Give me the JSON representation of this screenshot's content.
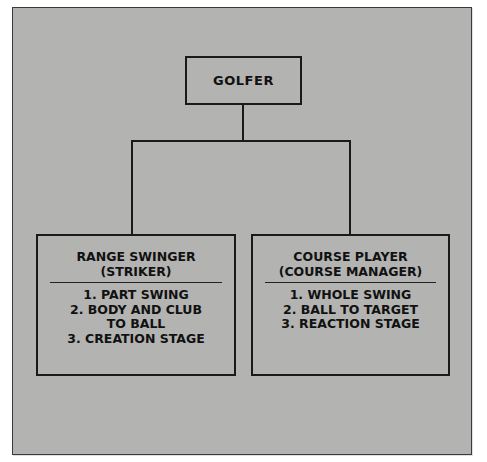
{
  "diagram": {
    "type": "hierarchy",
    "root": {
      "label": "GOLFER"
    },
    "children": [
      {
        "title_lines": [
          "RANGE SWINGER",
          "(STRIKER)"
        ],
        "items": [
          "1. PART SWING",
          "2. BODY AND CLUB",
          "TO BALL",
          "3. CREATION STAGE"
        ]
      },
      {
        "title_lines": [
          "COURSE PLAYER",
          "(COURSE MANAGER)"
        ],
        "items": [
          "1. WHOLE SWING",
          "2. BALL TO TARGET",
          "3. REACTION STAGE"
        ]
      }
    ],
    "colors": {
      "background": "#b3b3b1",
      "ink": "#1a1a1a"
    }
  }
}
